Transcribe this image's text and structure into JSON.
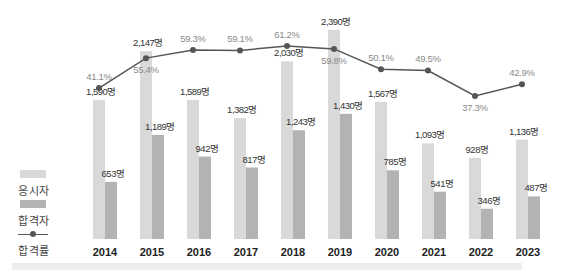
{
  "chart_data": {
    "type": "bar",
    "title": "",
    "xlabel": "",
    "ylabel": "",
    "categories": [
      "2014",
      "2015",
      "2016",
      "2017",
      "2018",
      "2019",
      "2020",
      "2021",
      "2022",
      "2023"
    ],
    "series": [
      {
        "name": "응시자",
        "type": "bar",
        "color": "#d9d9d9",
        "values": [
          1590,
          2147,
          1589,
          1382,
          2030,
          2390,
          1567,
          1093,
          928,
          1136
        ],
        "labels": [
          "1,590명",
          "2,147명",
          "1,589명",
          "1,382명",
          "2,030명",
          "2,390명",
          "1,567명",
          "1,093명",
          "928명",
          "1,136명"
        ]
      },
      {
        "name": "합격자",
        "type": "bar",
        "color": "#b3b3b3",
        "values": [
          653,
          1189,
          942,
          817,
          1243,
          1430,
          785,
          541,
          346,
          487
        ],
        "labels": [
          "653명",
          "1,189명",
          "942명",
          "817명",
          "1,243명",
          "1,430명",
          "785명",
          "541명",
          "346명",
          "487명"
        ]
      },
      {
        "name": "합격률",
        "type": "line",
        "color": "#555555",
        "values": [
          41.1,
          55.4,
          59.3,
          59.1,
          61.2,
          59.8,
          50.1,
          49.5,
          37.3,
          42.9
        ],
        "labels": [
          "41.1%",
          "55.4%",
          "59.3%",
          "59.1%",
          "61.2%",
          "59.8%",
          "50.1%",
          "49.5%",
          "37.3%",
          "42.9%"
        ]
      }
    ],
    "grid": false,
    "legend_position": "left"
  },
  "legend": {
    "applicants": "응시자",
    "passed": "합격자",
    "rate": "합격률"
  },
  "colors": {
    "applicants": "#d9d9d9",
    "passed": "#b3b3b3",
    "line": "#555555",
    "rate_label": "#8a8a8a",
    "count_label": "#333333"
  }
}
